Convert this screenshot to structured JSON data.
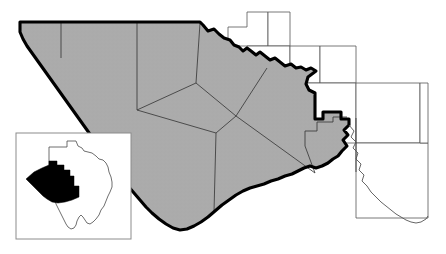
{
  "map": {
    "title": "West Texas Trans-Pecos / Big Bend regional county map",
    "region_label": "shaded-multi-county-region",
    "inset_label": "Texas state locator inset",
    "colors": {
      "region_fill": "#ababab",
      "region_outline": "#000000",
      "county_line": "#3a3a3a",
      "neighbor_fill": "#ffffff",
      "neighbor_line": "#555555",
      "inset_border": "#8c8c8c",
      "inset_state_line": "#4a4a4a",
      "inset_highlight": "#000000",
      "background": "#ffffff"
    },
    "region_outline_path": "M 52 23 L 190 23 L 410 23 L 409 25 L 416 31 L 422 29 L 428 33 L 430 38 L 438 40 L 443 46 L 450 47 L 458 51 L 465 55 L 470 62 L 479 64 L 487 70 L 497 71 L 505 76 L 515 76 L 523 81 L 533 86 L 541 92 L 552 95 L 562 100 L 572 106 L 580 112 L 590 117 L 598 126 L 608 132 L 618 140 L 625 148 L 633 154 L 641 160 L 648 167 L 655 170 L 660 176 L 666 182 L 672 186 L 676 192 L 684 196 L 690 201 L 696 203 L 700 210 L 705 214 L 708 222 L 712 228 L 716 233 L 720 238",
    "counties_shaded_count": 9,
    "neighbor_counties_count": 9
  }
}
